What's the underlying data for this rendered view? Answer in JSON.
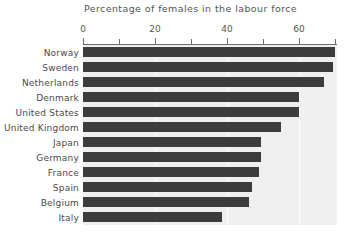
{
  "chart_data": {
    "type": "bar",
    "orientation": "horizontal",
    "title": "Percentage of females in the labour force",
    "xlabel": "",
    "ylabel": "",
    "xlim": [
      0,
      70.5
    ],
    "grid": true,
    "legend": null,
    "major_ticks": [
      0,
      20,
      40,
      60
    ],
    "minor_ticks": [
      10,
      30,
      50,
      70
    ],
    "tick_labels": [
      "0",
      "20",
      "40",
      "60"
    ],
    "categories": [
      "Norway",
      "Sweden",
      "Netherlands",
      "Denmark",
      "United States",
      "United Kingdom",
      "Japan",
      "Germany",
      "France",
      "Spain",
      "Belgium",
      "Italy"
    ],
    "values": [
      70,
      69.5,
      67,
      60,
      60,
      55,
      49.5,
      49.5,
      49,
      47,
      46,
      38.5
    ],
    "colors": {
      "bar": "#3c3c3c",
      "plot_background": "#efefef",
      "page_background": "#ffffff",
      "axis": "#6b6b6b",
      "gridline": "#fdfdfd",
      "text": "#4a4a4a"
    }
  }
}
